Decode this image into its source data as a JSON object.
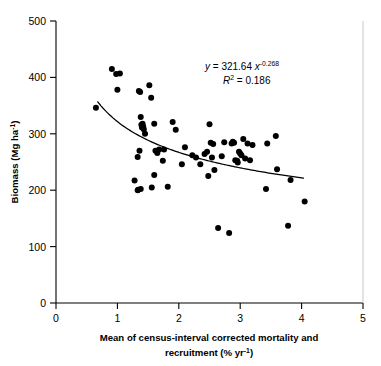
{
  "chart_data": {
    "type": "scatter",
    "title": "",
    "xlabel": "Mean of census-interval corrected mortality and recruitment (% yr−1)",
    "ylabel": "Biomass (Mg ha−1)",
    "xlim": [
      0,
      5
    ],
    "ylim": [
      0,
      500
    ],
    "xticks": [
      0,
      1,
      2,
      3,
      4,
      5
    ],
    "yticks": [
      0,
      100,
      200,
      300,
      400,
      500
    ],
    "xtick_labels": [
      "0",
      "1",
      "2",
      "3",
      "4",
      "5"
    ],
    "ytick_labels": [
      "0",
      "100",
      "200",
      "300",
      "400",
      "500"
    ],
    "grid": false,
    "legend": null,
    "marker": "filled-circle",
    "marker_color": "#000000",
    "fit_curve": {
      "type": "power",
      "equation_label": "y = 321.64 x",
      "equation_exponent": "-0.268",
      "r2_label": "R",
      "r2_sup": "2",
      "r2_value": "= 0.186",
      "coefficient": 321.64,
      "exponent": -0.268,
      "r_squared": 0.186,
      "x_start": 0.68,
      "x_end": 4.03
    },
    "annotations": [
      {
        "name": "regression-equation",
        "text": "y = 321.64 x-0.268"
      },
      {
        "name": "r-squared",
        "text": "R2 = 0.186"
      }
    ],
    "x": [
      0.65,
      0.91,
      0.98,
      1.04,
      1.0,
      1.28,
      1.33,
      1.35,
      1.37,
      1.38,
      1.4,
      1.41,
      1.39,
      1.42,
      1.43,
      1.45,
      1.36,
      1.34,
      1.33,
      1.38,
      1.52,
      1.55,
      1.6,
      1.62,
      1.65,
      1.68,
      1.6,
      1.56,
      1.74,
      1.76,
      1.82,
      1.9,
      1.95,
      2.05,
      2.1,
      2.22,
      2.28,
      2.35,
      2.42,
      2.46,
      2.5,
      2.52,
      2.48,
      2.54,
      2.56,
      2.58,
      2.64,
      2.7,
      2.74,
      2.82,
      2.86,
      2.88,
      2.9,
      2.92,
      2.95,
      2.96,
      2.98,
      3.0,
      3.02,
      3.05,
      3.08,
      3.12,
      3.16,
      3.2,
      3.42,
      3.44,
      3.58,
      3.6,
      3.78,
      3.82,
      4.05
    ],
    "y": [
      346,
      415,
      406,
      407,
      378,
      217,
      259,
      376,
      374,
      330,
      311,
      318,
      316,
      313,
      308,
      300,
      270,
      201,
      200,
      202,
      386,
      364,
      318,
      270,
      266,
      272,
      227,
      205,
      252,
      272,
      206,
      321,
      307,
      246,
      276,
      262,
      258,
      246,
      264,
      268,
      317,
      284,
      225,
      258,
      282,
      236,
      133,
      260,
      285,
      124,
      283,
      286,
      284,
      253,
      252,
      249,
      268,
      265,
      262,
      291,
      256,
      283,
      253,
      280,
      202,
      283,
      296,
      237,
      137,
      218,
      180
    ]
  },
  "figure": {
    "equation_line_1_prefix": "y",
    "equation_line_1_body": " = 321.64 ",
    "equation_line_1_var": "x",
    "equation_line_1_exp": "-0.268",
    "equation_line_2_var": "R",
    "equation_line_2_sup": "2",
    "equation_line_2_body": " = 0.186",
    "ylabel_main": "Biomass (Mg ha",
    "ylabel_sup": "-1",
    "ylabel_tail": ")",
    "xlabel_line_1": "Mean of census-interval corrected mortality and",
    "xlabel_line_2_main": "recruitment (% yr",
    "xlabel_line_2_sup": "-1",
    "xlabel_line_2_tail": ")"
  }
}
